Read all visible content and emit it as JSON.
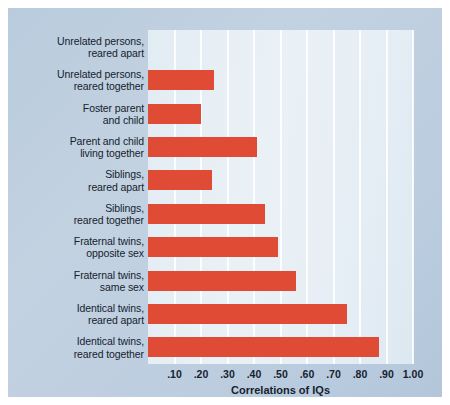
{
  "chart_data": {
    "type": "bar",
    "orientation": "horizontal",
    "title": "",
    "xlabel": "Correlations of IQs",
    "ylabel": "",
    "xlim": [
      0,
      1.0
    ],
    "grid": true,
    "legend": false,
    "bar_color": "#e04b36",
    "categories": [
      "Unrelated persons,\nreared apart",
      "Unrelated persons,\nreared together",
      "Foster parent\nand child",
      "Parent and child\nliving together",
      "Siblings,\nreared apart",
      "Siblings,\nreared together",
      "Fraternal twins,\nopposite sex",
      "Fraternal twins,\nsame sex",
      "Identical twins,\nreared apart",
      "Identical twins,\nreared together"
    ],
    "values": [
      0.0,
      0.25,
      0.2,
      0.41,
      0.24,
      0.44,
      0.49,
      0.56,
      0.75,
      0.87
    ],
    "xticks": [
      0.1,
      0.2,
      0.3,
      0.4,
      0.5,
      0.6,
      0.7,
      0.8,
      0.9,
      1.0
    ],
    "xticklabels": [
      ".10",
      ".20",
      ".30",
      ".40",
      ".50",
      ".60",
      ".70",
      ".80",
      ".90",
      "1.00"
    ]
  },
  "colors": {
    "bar": "#e04b36",
    "panel": "#bccddf",
    "plot": "#e5edf4",
    "gridline": "#ffffff",
    "text": "#16222e"
  }
}
